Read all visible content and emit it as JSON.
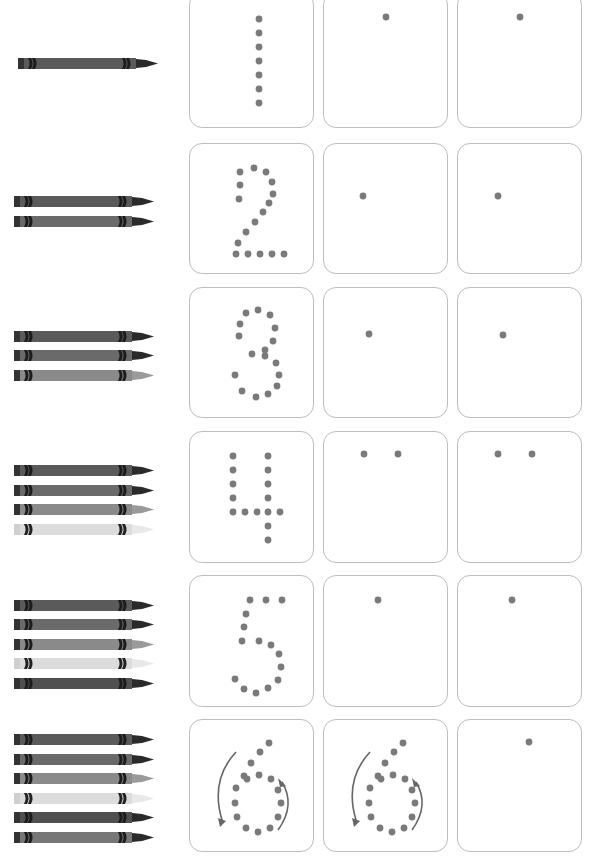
{
  "worksheet": {
    "title": "Counting crayons and tracing numbers 1-6",
    "dot_color": "#7a7a7a",
    "box_border_color": "#bdbdbd",
    "rows": [
      {
        "number": 1,
        "crayon_count": 1,
        "crayons": [
          "#5a5a5a"
        ],
        "top": -8,
        "height": 136,
        "trace_dots": [
          [
            69,
            18
          ],
          [
            69,
            32
          ],
          [
            69,
            46
          ],
          [
            69,
            60
          ],
          [
            69,
            74
          ],
          [
            69,
            88
          ],
          [
            69,
            102
          ]
        ],
        "practice_dots": [
          [
            [
              62,
              16
            ]
          ],
          [
            [
              62,
              16
            ]
          ]
        ]
      },
      {
        "number": 2,
        "crayon_count": 2,
        "crayons": [
          "#5a5a5a",
          "#6a6a6a"
        ],
        "top": 143,
        "height": 131,
        "trace_dots": [
          [
            50,
            28
          ],
          [
            64,
            24
          ],
          [
            76,
            28
          ],
          [
            82,
            38
          ],
          [
            50,
            41
          ],
          [
            83,
            50
          ],
          [
            49,
            55
          ],
          [
            79,
            59
          ],
          [
            73,
            68
          ],
          [
            65,
            78
          ],
          [
            56,
            88
          ],
          [
            48,
            99
          ],
          [
            46,
            110
          ],
          [
            58,
            110
          ],
          [
            70,
            110
          ],
          [
            82,
            110
          ],
          [
            94,
            110
          ]
        ],
        "practice_dots": [
          [
            [
              39,
              52
            ]
          ],
          [
            [
              40,
              52
            ]
          ]
        ]
      },
      {
        "number": 3,
        "crayon_count": 3,
        "crayons": [
          "#5a5a5a",
          "#6a6a6a",
          "#8a8a8a"
        ],
        "top": 287,
        "height": 131,
        "trace_dots": [
          [
            56,
            25
          ],
          [
            68,
            22
          ],
          [
            80,
            27
          ],
          [
            50,
            36
          ],
          [
            85,
            40
          ],
          [
            49,
            48
          ],
          [
            83,
            53
          ],
          [
            62,
            66
          ],
          [
            75,
            62
          ],
          [
            75,
            68
          ],
          [
            86,
            75
          ],
          [
            45,
            87
          ],
          [
            89,
            87
          ],
          [
            52,
            103
          ],
          [
            87,
            98
          ],
          [
            66,
            109
          ],
          [
            78,
            106
          ]
        ],
        "practice_dots": [
          [
            [
              45,
              46
            ]
          ],
          [
            [
              45,
              47
            ]
          ]
        ]
      },
      {
        "number": 4,
        "crayon_count": 4,
        "crayons": [
          "#5a5a5a",
          "#6a6a6a",
          "#8a8a8a",
          "#dcdcdc"
        ],
        "top": 431,
        "height": 132,
        "trace_dots": [
          [
            43,
            24
          ],
          [
            78,
            24
          ],
          [
            43,
            38
          ],
          [
            78,
            38
          ],
          [
            43,
            52
          ],
          [
            78,
            52
          ],
          [
            43,
            66
          ],
          [
            78,
            66
          ],
          [
            43,
            80
          ],
          [
            55,
            80
          ],
          [
            67,
            80
          ],
          [
            78,
            80
          ],
          [
            90,
            80
          ],
          [
            78,
            94
          ],
          [
            78,
            108
          ]
        ],
        "practice_dots": [
          [
            [
              40,
              22
            ],
            [
              74,
              22
            ]
          ],
          [
            [
              40,
              22
            ],
            [
              74,
              22
            ]
          ]
        ]
      },
      {
        "number": 5,
        "crayon_count": 5,
        "crayons": [
          "#5a5a5a",
          "#6a6a6a",
          "#8a8a8a",
          "#dcdcdc",
          "#505050"
        ],
        "top": 575,
        "height": 132,
        "trace_dots": [
          [
            60,
            24
          ],
          [
            76,
            24
          ],
          [
            92,
            24
          ],
          [
            56,
            38
          ],
          [
            54,
            51
          ],
          [
            52,
            65
          ],
          [
            69,
            65
          ],
          [
            81,
            69
          ],
          [
            89,
            78
          ],
          [
            91,
            91
          ],
          [
            45,
            103
          ],
          [
            88,
            104
          ],
          [
            54,
            113
          ],
          [
            66,
            117
          ],
          [
            78,
            112
          ]
        ],
        "practice_dots": [
          [
            [
              54,
              24
            ]
          ],
          [
            [
              54,
              24
            ]
          ]
        ]
      },
      {
        "number": 6,
        "crayon_count": 6,
        "crayons": [
          "#5a5a5a",
          "#6a6a6a",
          "#8a8a8a",
          "#dcdcdc",
          "#505050",
          "#777777"
        ],
        "top": 719,
        "height": 133,
        "trace_dots": [
          [
            79,
            23
          ],
          [
            70,
            32
          ],
          [
            61,
            43
          ],
          [
            54,
            56
          ],
          [
            57,
            59
          ],
          [
            69,
            55
          ],
          [
            81,
            59
          ],
          [
            46,
            68
          ],
          [
            88,
            70
          ],
          [
            45,
            83
          ],
          [
            91,
            83
          ],
          [
            47,
            97
          ],
          [
            88,
            97
          ],
          [
            56,
            108
          ],
          [
            68,
            112
          ],
          [
            80,
            108
          ]
        ],
        "practice_dots": [
          "trace",
          [
            [
              71,
              22
            ]
          ]
        ]
      }
    ]
  }
}
